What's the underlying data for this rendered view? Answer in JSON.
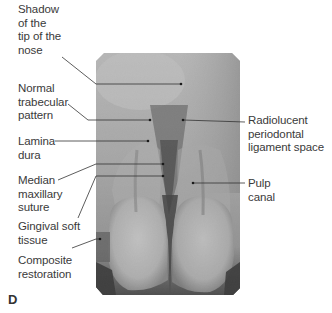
{
  "figure": {
    "panel_letter": "D",
    "labels_left": [
      {
        "id": "shadow-nose",
        "text": "Shadow\nof the\ntip of the\nnose"
      },
      {
        "id": "trabecular",
        "text": "Normal\ntrabecular\npattern"
      },
      {
        "id": "lamina-dura",
        "text": "Lamina\ndura"
      },
      {
        "id": "median-suture",
        "text": "Median\nmaxillary\nsuture"
      },
      {
        "id": "gingival",
        "text": "Gingival soft\ntissue"
      },
      {
        "id": "composite",
        "text": "Composite\nrestoration"
      }
    ],
    "labels_right": [
      {
        "id": "pdl-space",
        "text": "Radiolucent\nperiodontal\nligament space"
      },
      {
        "id": "pulp-canal",
        "text": "Pulp\ncanal"
      }
    ],
    "colors": {
      "text": "#3a3a3a",
      "leader": "#333333",
      "film_light": "#d9d9d9",
      "film_dark": "#1e1e1e"
    }
  }
}
